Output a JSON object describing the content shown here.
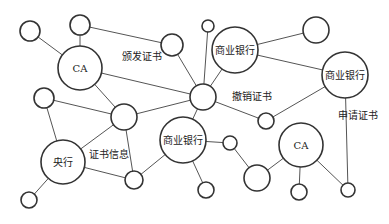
{
  "diagram": {
    "type": "network",
    "nodes": [
      {
        "id": "n1",
        "x": 30,
        "y": 31,
        "r": 10,
        "label": ""
      },
      {
        "id": "n2",
        "x": 80,
        "y": 25,
        "r": 10,
        "label": ""
      },
      {
        "id": "ca1",
        "x": 80,
        "y": 68,
        "r": 22,
        "label": "CA"
      },
      {
        "id": "n4",
        "x": 172,
        "y": 45,
        "r": 11,
        "label": ""
      },
      {
        "id": "n5",
        "x": 208,
        "y": 26,
        "r": 6,
        "label": ""
      },
      {
        "id": "bank1",
        "x": 235,
        "y": 50,
        "r": 23,
        "label": "商业银行"
      },
      {
        "id": "n7",
        "x": 316,
        "y": 30,
        "r": 13,
        "label": ""
      },
      {
        "id": "bank2",
        "x": 345,
        "y": 75,
        "r": 23,
        "label": "商业银行"
      },
      {
        "id": "hub",
        "x": 203,
        "y": 97,
        "r": 13,
        "label": ""
      },
      {
        "id": "n10",
        "x": 44,
        "y": 98,
        "r": 10,
        "label": ""
      },
      {
        "id": "n11",
        "x": 124,
        "y": 117,
        "r": 13,
        "label": ""
      },
      {
        "id": "n12",
        "x": 266,
        "y": 121,
        "r": 8,
        "label": ""
      },
      {
        "id": "central",
        "x": 63,
        "y": 162,
        "r": 22,
        "label": "央行"
      },
      {
        "id": "bank3",
        "x": 183,
        "y": 140,
        "r": 23,
        "label": "商业银行"
      },
      {
        "id": "n15",
        "x": 230,
        "y": 143,
        "r": 7,
        "label": ""
      },
      {
        "id": "n16",
        "x": 134,
        "y": 180,
        "r": 9,
        "label": ""
      },
      {
        "id": "n17",
        "x": 29,
        "y": 200,
        "r": 8,
        "label": ""
      },
      {
        "id": "n18",
        "x": 206,
        "y": 190,
        "r": 8,
        "label": ""
      },
      {
        "id": "n19",
        "x": 257,
        "y": 178,
        "r": 13,
        "label": ""
      },
      {
        "id": "ca2",
        "x": 301,
        "y": 145,
        "r": 22,
        "label": "CA"
      },
      {
        "id": "n21",
        "x": 299,
        "y": 192,
        "r": 8,
        "label": ""
      },
      {
        "id": "n22",
        "x": 348,
        "y": 190,
        "r": 7,
        "label": ""
      }
    ],
    "edges": [
      [
        "n1",
        "ca1"
      ],
      [
        "n2",
        "ca1"
      ],
      [
        "n2",
        "n4"
      ],
      [
        "ca1",
        "hub"
      ],
      [
        "ca1",
        "n11"
      ],
      [
        "n4",
        "hub"
      ],
      [
        "n5",
        "hub"
      ],
      [
        "n10",
        "n11"
      ],
      [
        "n10",
        "central"
      ],
      [
        "n11",
        "hub"
      ],
      [
        "n11",
        "n16"
      ],
      [
        "central",
        "n11"
      ],
      [
        "central",
        "n16"
      ],
      [
        "central",
        "n17"
      ],
      [
        "hub",
        "bank1"
      ],
      [
        "bank1",
        "n7"
      ],
      [
        "bank1",
        "bank2"
      ],
      [
        "hub",
        "n12"
      ],
      [
        "hub",
        "bank3"
      ],
      [
        "bank2",
        "n12"
      ],
      [
        "bank2",
        "n22"
      ],
      [
        "bank3",
        "n16"
      ],
      [
        "bank3",
        "n18"
      ],
      [
        "bank3",
        "n15"
      ],
      [
        "n15",
        "n19"
      ],
      [
        "n19",
        "ca2"
      ],
      [
        "ca2",
        "n21"
      ],
      [
        "ca2",
        "n22"
      ]
    ],
    "edge_labels": [
      {
        "id": "issue-cert",
        "text": "颁发证书",
        "x": 122,
        "y": 60
      },
      {
        "id": "revoke-cert",
        "text": "撤销证书",
        "x": 232,
        "y": 100
      },
      {
        "id": "apply-cert",
        "text": "申请证书",
        "x": 338,
        "y": 119
      },
      {
        "id": "cert-info",
        "text": "证书信息",
        "x": 89,
        "y": 158
      }
    ],
    "colors": {
      "edge": "#555555",
      "node_stroke": "#333333",
      "node_fill": "#ffffff",
      "text": "#222222"
    }
  }
}
